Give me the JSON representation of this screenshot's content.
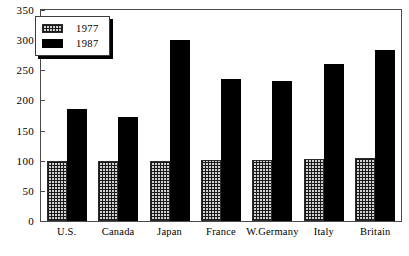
{
  "chart_data": {
    "type": "bar",
    "title": "",
    "subtitle": "",
    "xlabel": "",
    "ylabel": "",
    "ylim": [
      0,
      350
    ],
    "grid": false,
    "legend_position": "top-left",
    "categories": [
      "U.S.",
      "Canada",
      "Japan",
      "France",
      "W.Germany",
      "Italy",
      "Britain"
    ],
    "yticks": [
      0,
      50,
      100,
      150,
      200,
      250,
      300,
      350
    ],
    "ytick_labels": [
      "0",
      "50",
      "100",
      "150",
      "200",
      "250",
      "300",
      "350"
    ],
    "series": [
      {
        "name": "1977",
        "fill": "hatched",
        "color": "#d2d2d2",
        "values": [
          100,
          100,
          100,
          102,
          102,
          103,
          104
        ]
      },
      {
        "name": "1987",
        "fill": "solid",
        "color": "#000000",
        "values": [
          186,
          172,
          300,
          235,
          232,
          261,
          283
        ]
      }
    ]
  },
  "legend": {
    "entries": [
      {
        "label": "1977"
      },
      {
        "label": "1987"
      }
    ]
  },
  "colors": {
    "axis": "#4a4a4a",
    "frame": "#4a4a4a",
    "series_1977": "#d2d2d2",
    "series_1987": "#000000",
    "background": "#ffffff"
  }
}
